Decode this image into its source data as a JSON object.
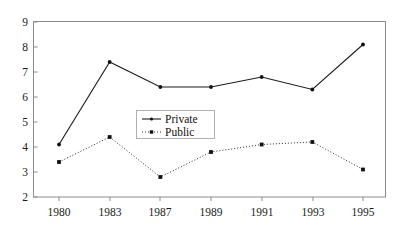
{
  "chart_data": {
    "type": "line",
    "title": "",
    "xlabel": "",
    "ylabel": "",
    "categories": [
      "1980",
      "1983",
      "1987",
      "1989",
      "1991",
      "1993",
      "1995"
    ],
    "x": [
      1980,
      1983,
      1987,
      1989,
      1991,
      1993,
      1995
    ],
    "series": [
      {
        "name": "Private",
        "values": [
          4.1,
          7.4,
          6.4,
          6.4,
          6.8,
          6.3,
          8.1
        ],
        "line_style": "solid",
        "marker": "dot",
        "color": "#1a1a1a"
      },
      {
        "name": "Public",
        "values": [
          3.4,
          4.4,
          2.8,
          3.8,
          4.1,
          4.2,
          3.1
        ],
        "line_style": "dotted",
        "marker": "square",
        "color": "#2b2b2b"
      }
    ],
    "ylim": [
      2,
      9
    ],
    "xlim": [
      1980,
      1995
    ],
    "y_ticks": [
      2,
      3,
      4,
      5,
      6,
      7,
      8,
      9
    ],
    "y_tick_labels": [
      "2",
      "3",
      "4",
      "5",
      "6",
      "7",
      "8",
      "9"
    ],
    "x_tick_labels": [
      "1980",
      "1983",
      "1987",
      "1989",
      "1991",
      "1993",
      "1995"
    ],
    "grid": false,
    "legend_position": "center",
    "legend_entries": [
      "Private",
      "Public"
    ],
    "frame_color": "#8c8c8c",
    "background_color": "#ffffff"
  },
  "legend": {
    "entries": [
      {
        "label": "Private"
      },
      {
        "label": "Public"
      }
    ]
  },
  "axes": {
    "y_labels": [
      "9",
      "8",
      "7",
      "6",
      "5",
      "4",
      "3",
      "2"
    ],
    "x_labels": [
      "1980",
      "1983",
      "1987",
      "1989",
      "1991",
      "1993",
      "1995"
    ]
  }
}
